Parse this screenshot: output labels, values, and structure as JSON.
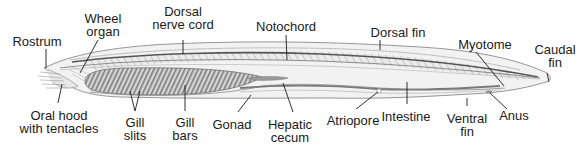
{
  "diagram": {
    "labels": [
      {
        "id": "rostrum",
        "lines": [
          "Rostrum"
        ],
        "x": 37,
        "y": 35,
        "line": [
          [
            46,
            49
          ],
          [
            46,
            68
          ]
        ]
      },
      {
        "id": "wheel-organ",
        "lines": [
          "Wheel",
          "organ"
        ],
        "x": 103,
        "y": 12,
        "line": [
          [
            98,
            40
          ],
          [
            80,
            73
          ]
        ]
      },
      {
        "id": "dorsal-nerve-cord",
        "lines": [
          "Dorsal",
          "nerve cord"
        ],
        "x": 183,
        "y": 5,
        "line": [
          [
            183,
            40
          ],
          [
            183,
            54
          ]
        ]
      },
      {
        "id": "notochord",
        "lines": [
          "Notochord"
        ],
        "x": 286,
        "y": 20,
        "line": [
          [
            286,
            35
          ],
          [
            287,
            60
          ]
        ]
      },
      {
        "id": "dorsal-fin",
        "lines": [
          "Dorsal fin"
        ],
        "x": 398,
        "y": 26,
        "line": [
          [
            380,
            40
          ],
          [
            380,
            50
          ]
        ]
      },
      {
        "id": "myotome",
        "lines": [
          "Myotome"
        ],
        "x": 485,
        "y": 38,
        "line": [
          [
            476,
            52
          ],
          [
            504,
            86
          ]
        ]
      },
      {
        "id": "caudal-fin",
        "lines": [
          "Caudal",
          "fin"
        ],
        "x": 555,
        "y": 43,
        "line": [
          [
            547,
            73
          ],
          [
            549,
            82
          ]
        ]
      },
      {
        "id": "oral-hood",
        "lines": [
          "Oral hood",
          "with tentacles"
        ],
        "x": 59,
        "y": 109,
        "line": [
          [
            62,
            84
          ],
          [
            58,
            103
          ]
        ]
      },
      {
        "id": "gill-slits",
        "lines": [
          "Gill",
          "slits"
        ],
        "x": 135,
        "y": 116,
        "line": [
          [
            130,
            91
          ],
          [
            135,
            111
          ],
          [
            140,
            91
          ]
        ]
      },
      {
        "id": "gill-bars",
        "lines": [
          "Gill",
          "bars"
        ],
        "x": 185,
        "y": 116,
        "line": [
          [
            185,
            85
          ],
          [
            185,
            111
          ]
        ]
      },
      {
        "id": "gonad",
        "lines": [
          "Gonad"
        ],
        "x": 232,
        "y": 118,
        "line": [
          [
            251,
            95
          ],
          [
            238,
            112
          ]
        ]
      },
      {
        "id": "hepatic-cecum",
        "lines": [
          "Hepatic",
          "cecum"
        ],
        "x": 290,
        "y": 118,
        "line": [
          [
            283,
            83
          ],
          [
            293,
            112
          ]
        ]
      },
      {
        "id": "atriopore",
        "lines": [
          "Atriopore"
        ],
        "x": 353,
        "y": 114,
        "line": [
          [
            378,
            92
          ],
          [
            356,
            109
          ]
        ]
      },
      {
        "id": "intestine",
        "lines": [
          "Intestine"
        ],
        "x": 406,
        "y": 110,
        "line": [
          [
            407,
            82
          ],
          [
            407,
            104
          ]
        ]
      },
      {
        "id": "ventral-fin",
        "lines": [
          "Ventral",
          "fin"
        ],
        "x": 467,
        "y": 112,
        "line": [
          [
            467,
            98
          ],
          [
            467,
            106
          ]
        ]
      },
      {
        "id": "anus",
        "lines": [
          "Anus"
        ],
        "x": 514,
        "y": 109,
        "line": [
          [
            490,
            93
          ],
          [
            507,
            109
          ]
        ]
      }
    ]
  },
  "colors": {
    "outline": "#6b6b6b",
    "body_fill": "#efefef",
    "notochord": "#8a8a8a",
    "gill_fill": "#cfcfcf",
    "gill_stripe": "#7a7a7a",
    "leader": "#1a1a1a",
    "text": "#1a1a1a"
  }
}
